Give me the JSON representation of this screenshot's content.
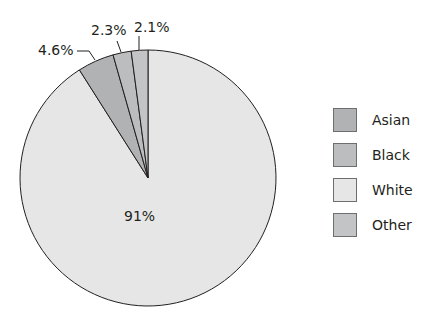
{
  "chart_data": {
    "type": "pie",
    "title": "",
    "slices": [
      {
        "label": "White",
        "value": 91,
        "display": "91%",
        "color": "#e6e6e7"
      },
      {
        "label": "Asian",
        "value": 4.6,
        "display": "4.6%",
        "color": "#b1b2b4"
      },
      {
        "label": "Black",
        "value": 2.3,
        "display": "2.3%",
        "color": "#bcbdbf"
      },
      {
        "label": "Other",
        "value": 2.1,
        "display": "2.1%",
        "color": "#c3c4c6"
      }
    ],
    "legend": {
      "position": "right",
      "entries": [
        "Asian",
        "Black",
        "White",
        "Other"
      ]
    }
  },
  "legend": {
    "items": [
      {
        "label": "Asian",
        "color": "#b1b2b4"
      },
      {
        "label": "Black",
        "color": "#bcbdbf"
      },
      {
        "label": "White",
        "color": "#e6e6e7"
      },
      {
        "label": "Other",
        "color": "#c3c4c6"
      }
    ]
  },
  "labels": {
    "white": "91%",
    "asian": "4.6%",
    "black": "2.3%",
    "other": "2.1%"
  }
}
